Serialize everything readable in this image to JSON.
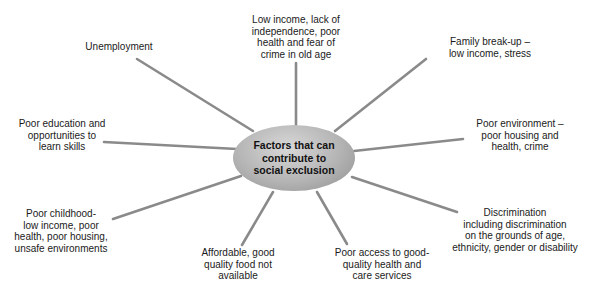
{
  "center": {
    "label": "Factors that can\ncontribute to\nsocial exclusion"
  },
  "nodes": [
    {
      "id": "unemployment",
      "label": "Unemployment"
    },
    {
      "id": "old-age",
      "label": "Low income, lack of\nindependence, poor\nhealth and fear of\ncrime in old age"
    },
    {
      "id": "family-breakup",
      "label": "Family break-up –\nlow income, stress"
    },
    {
      "id": "poor-education",
      "label": "Poor education and\nopportunities to\nlearn skills"
    },
    {
      "id": "poor-environment",
      "label": "Poor environment –\npoor housing and\nhealth, crime"
    },
    {
      "id": "poor-childhood",
      "label": "Poor childhood-\nlow income, poor\nhealth, poor housing,\nunsafe environments"
    },
    {
      "id": "discrimination",
      "label": "Discrimination\nincluding discrimination\non the grounds of age,\nethnicity, gender or disability"
    },
    {
      "id": "food",
      "label": "Affordable, good\nquality food not\navailable"
    },
    {
      "id": "health-services",
      "label": "Poor access to good-\nquality health and\ncare services"
    }
  ],
  "colors": {
    "line": "#8a8a8a",
    "hub_light": "#d8d8d8",
    "hub_dark": "#8e8e8e",
    "text": "#1a1a1a"
  }
}
